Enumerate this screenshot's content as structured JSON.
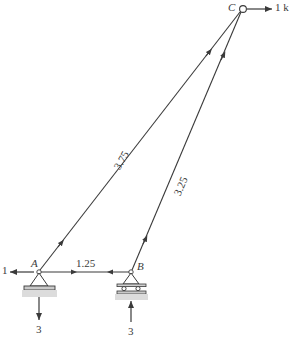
{
  "figure": {
    "type": "truss-free-body-diagram",
    "stroke_color": "#3a3a3a",
    "support_fill": "#d9d9d9",
    "joints": [
      {
        "id": "A",
        "label": "A",
        "x": 39,
        "y": 272,
        "support": "pin"
      },
      {
        "id": "B",
        "label": "B",
        "x": 131,
        "y": 272,
        "support": "roller"
      },
      {
        "id": "C",
        "label": "C",
        "x": 242,
        "y": 9,
        "support": "none"
      }
    ],
    "members": [
      {
        "id": "AB",
        "from": "A",
        "to": "B",
        "label": "1.25"
      },
      {
        "id": "AC",
        "from": "A",
        "to": "C",
        "label": "3.75"
      },
      {
        "id": "BC",
        "from": "B",
        "to": "C",
        "label": "3.25"
      }
    ],
    "forces": [
      {
        "id": "force-at-A-horizontal",
        "label": "1",
        "direction": "left",
        "at": "A"
      },
      {
        "id": "force-at-C-horizontal",
        "label": "1 k",
        "direction": "right",
        "at": "C"
      },
      {
        "id": "reaction-at-A-vertical",
        "label": "3",
        "direction": "down",
        "at": "A"
      },
      {
        "id": "reaction-at-B-vertical",
        "label": "3",
        "direction": "up",
        "at": "B"
      }
    ]
  }
}
